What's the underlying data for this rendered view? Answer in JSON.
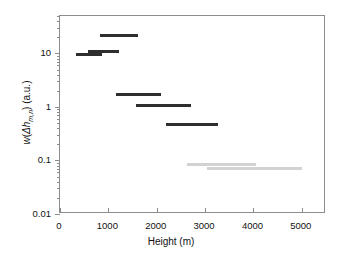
{
  "chart_data": {
    "type": "bar",
    "title": "",
    "subtitle": "",
    "xlabel": "Height (m)",
    "ylabel_plain": "w(Δh_m,n) (a.u.)",
    "ylabel_parts": {
      "w": "w",
      "open": "(",
      "delta_h": "Δh",
      "subscript": "m,n",
      "close": ")",
      "units": " (a.u.)"
    },
    "xlim": [
      0,
      5500
    ],
    "ylim": [
      0.01,
      50
    ],
    "yscale": "log",
    "xscale": "linear",
    "grid": false,
    "legend": null,
    "xticks": [
      0,
      1000,
      2000,
      3000,
      4000,
      5000
    ],
    "xticklabels": [
      "0",
      "1000",
      "2000",
      "3000",
      "4000",
      "5000"
    ],
    "yticks": [
      0.01,
      0.1,
      1,
      10
    ],
    "yticklabels": [
      "0.01",
      "0.1",
      "1",
      "10"
    ],
    "series": [
      {
        "name": "dark-segments",
        "color": "#2e2e2e",
        "segments": [
          {
            "x_start": 830,
            "x_end": 1620,
            "value": 22.0
          },
          {
            "x_start": 580,
            "x_end": 1210,
            "value": 11.0
          },
          {
            "x_start": 330,
            "x_end": 870,
            "value": 9.6
          },
          {
            "x_start": 1150,
            "x_end": 2080,
            "value": 1.7
          },
          {
            "x_start": 1580,
            "x_end": 2700,
            "value": 1.05
          },
          {
            "x_start": 2190,
            "x_end": 3270,
            "value": 0.48
          }
        ]
      },
      {
        "name": "light-segments",
        "color": "#d2d2d2",
        "segments": [
          {
            "x_start": 2620,
            "x_end": 4060,
            "value": 0.085
          },
          {
            "x_start": 3030,
            "x_end": 5010,
            "value": 0.07
          }
        ]
      }
    ]
  },
  "axes": {
    "frame_color": "#8c8c8c",
    "background": "#ffffff"
  }
}
